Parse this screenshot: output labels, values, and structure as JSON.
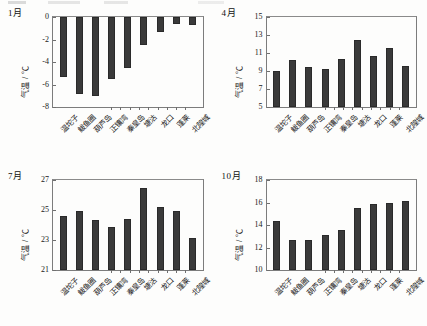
{
  "figure": {
    "background_color": "#fdfdfc",
    "bar_color": "#3a3a3a",
    "axis_color": "#7c7c7c"
  },
  "stations": [
    "温坨子",
    "鲅鱼圈",
    "葫芦岛",
    "正镶湾",
    "秦皇岛",
    "塘沽",
    "龙口",
    "蓬莱",
    "北隍城"
  ],
  "axis_label": "气温 / ℃",
  "panels": [
    {
      "month_label": "1月",
      "ylabel": "气温 / ℃",
      "yticks": [
        "0",
        "-2",
        "-4",
        "-6",
        "-8"
      ],
      "ytick_values": [
        0,
        -2,
        -4,
        -6,
        -8
      ],
      "ylim": [
        -8,
        0
      ]
    },
    {
      "month_label": "4月",
      "ylabel": "气温 / ℃",
      "yticks": [
        "15",
        "13",
        "11",
        "9",
        "7",
        "5"
      ],
      "ytick_values": [
        15,
        13,
        11,
        9,
        7,
        5
      ],
      "ylim": [
        5,
        15
      ]
    },
    {
      "month_label": "7月",
      "ylabel": "气温 / ℃",
      "yticks": [
        "27",
        "25",
        "23",
        "21"
      ],
      "ytick_values": [
        27,
        25,
        23,
        21
      ],
      "ylim": [
        21,
        27
      ]
    },
    {
      "month_label": "10月",
      "ylabel": "气温 / ℃",
      "yticks": [
        "18",
        "16",
        "14",
        "12",
        "10"
      ],
      "ytick_values": [
        18,
        16,
        14,
        12,
        10
      ],
      "ylim": [
        10,
        18
      ]
    }
  ],
  "chart_data": [
    {
      "type": "bar",
      "title": "1月",
      "xlabel": "",
      "ylabel": "气温 / ℃",
      "categories": [
        "温坨子",
        "鲅鱼圈",
        "葫芦岛",
        "正镶湾",
        "秦皇岛",
        "塘沽",
        "龙口",
        "蓬莱",
        "北隍城"
      ],
      "values": [
        -5.35,
        -6.85,
        -7.0,
        -5.5,
        -4.5,
        -2.5,
        -1.3,
        -0.6,
        -0.7
      ],
      "ylim": [
        -8,
        0
      ],
      "yticks": [
        0,
        -2,
        -4,
        -6,
        -8
      ],
      "grid": false,
      "legend": "none"
    },
    {
      "type": "bar",
      "title": "4月",
      "xlabel": "",
      "ylabel": "气温 / ℃",
      "categories": [
        "温坨子",
        "鲅鱼圈",
        "葫芦岛",
        "正镶湾",
        "秦皇岛",
        "塘沽",
        "龙口",
        "蓬莱",
        "北隍城"
      ],
      "values": [
        9.05,
        10.2,
        9.5,
        9.2,
        10.3,
        12.5,
        10.7,
        11.6,
        9.55
      ],
      "ylim": [
        5,
        15
      ],
      "yticks": [
        5,
        7,
        9,
        11,
        13,
        15
      ],
      "grid": false,
      "legend": "none"
    },
    {
      "type": "bar",
      "title": "7月",
      "xlabel": "",
      "ylabel": "气温 / ℃",
      "categories": [
        "温坨子",
        "鲅鱼圈",
        "葫芦岛",
        "正镶湾",
        "秦皇岛",
        "塘沽",
        "龙口",
        "蓬莱",
        "北隍城"
      ],
      "values": [
        24.6,
        24.95,
        24.35,
        23.85,
        24.4,
        26.5,
        25.2,
        24.95,
        23.15
      ],
      "ylim": [
        21,
        27
      ],
      "yticks": [
        21,
        23,
        25,
        27
      ],
      "grid": false,
      "legend": "none"
    },
    {
      "type": "bar",
      "title": "10月",
      "xlabel": "",
      "ylabel": "气温 / ℃",
      "categories": [
        "温坨子",
        "鲅鱼圈",
        "葫芦岛",
        "正镶湾",
        "秦皇岛",
        "塘沽",
        "龙口",
        "蓬莱",
        "北隍城"
      ],
      "values": [
        14.4,
        12.7,
        12.65,
        13.15,
        13.6,
        15.5,
        15.9,
        15.95,
        16.1
      ],
      "ylim": [
        10,
        18
      ],
      "yticks": [
        10,
        12,
        14,
        16,
        18
      ],
      "grid": false,
      "legend": "none"
    }
  ]
}
